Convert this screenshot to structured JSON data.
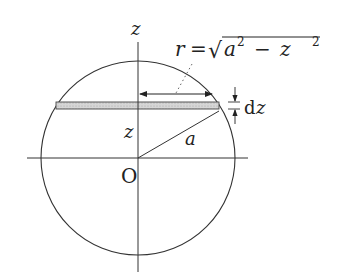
{
  "diagram": {
    "labels": {
      "z_axis": "z",
      "origin": "O",
      "z_height": "z",
      "radius": "a",
      "formula_r": "r",
      "formula_eq": "=",
      "formula_sqrt": "√",
      "formula_a": "a",
      "formula_a_exp": "2",
      "formula_minus": "−",
      "formula_z": "z",
      "formula_z_exp": "2",
      "dz_d": "d",
      "dz_z": "z"
    },
    "colors": {
      "line": "#333333",
      "strip_fill": "#cfcfcf"
    }
  }
}
